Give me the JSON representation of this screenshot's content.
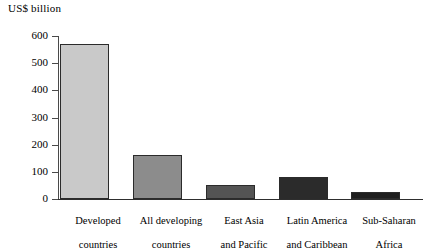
{
  "chart_data": {
    "type": "bar",
    "title": "US$ billion",
    "xlabel": "",
    "ylabel": "US$ billion",
    "ylim": [
      0,
      600
    ],
    "yticks": [
      0,
      100,
      200,
      300,
      400,
      500,
      600
    ],
    "grid": false,
    "legend": null,
    "categories": [
      "Developed\ncountries",
      "All developing\ncountries",
      "East Asia\nand Pacific",
      "Latin America\nand Caribbean",
      "Sub-Saharan\nAfrica"
    ],
    "values": [
      570,
      162,
      52,
      81,
      26
    ],
    "bar_colors": [
      "#c9c9c9",
      "#8c8c8c",
      "#545454",
      "#2b2b2b",
      "#1f1f1f"
    ]
  },
  "axis": {
    "title": "US$ billion",
    "tick_labels": [
      "600",
      "500",
      "400",
      "300",
      "200",
      "100",
      "0"
    ]
  },
  "categories": {
    "c0_line1": "Developed",
    "c0_line2": "countries",
    "c1_line1": "All developing",
    "c1_line2": "countries",
    "c2_line1": "East Asia",
    "c2_line2": "and Pacific",
    "c3_line1": "Latin America",
    "c3_line2": "and Caribbean",
    "c4_line1": "Sub-Saharan",
    "c4_line2": "Africa"
  }
}
